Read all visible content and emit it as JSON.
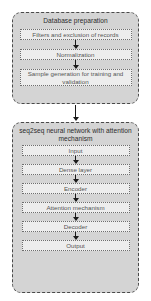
{
  "diagram": {
    "type": "flowchart",
    "background_color": "#ffffff",
    "group_fill_color": "#d4d4d4",
    "group_border_color": "#4a4a4a",
    "step_fill_color": "#ededed",
    "step_border_color": "#6e6e6e",
    "arrow_color": "#1a1a1a",
    "groups": [
      {
        "id": "database-preparation",
        "title": "Database preparation",
        "steps": [
          {
            "label": "Filters and exclusion of records"
          },
          {
            "label": "Normalization"
          },
          {
            "label": "Sample generation for training and validation"
          }
        ]
      },
      {
        "id": "seq2seq-neural-network",
        "title": "seq2seq neural network with attention mechanism",
        "steps": [
          {
            "label": "Input"
          },
          {
            "label": "Dense layer"
          },
          {
            "label": "Encoder"
          },
          {
            "label": "Attention mechanism"
          },
          {
            "label": "Decoder"
          },
          {
            "label": "Output"
          }
        ]
      }
    ]
  }
}
